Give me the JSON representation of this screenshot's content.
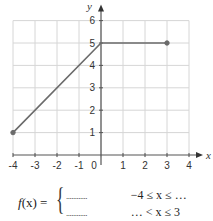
{
  "chart_data": {
    "type": "line",
    "title": "",
    "xlabel": "x",
    "ylabel": "y",
    "xlim": [
      -4,
      4
    ],
    "ylim": [
      0,
      6
    ],
    "grid": true,
    "x_ticks": [
      "-4",
      "-3",
      "-2",
      "-1",
      "0",
      "1",
      "2",
      "3",
      "4"
    ],
    "y_ticks": [
      "1",
      "2",
      "3",
      "4",
      "5",
      "6"
    ],
    "series": [
      {
        "name": "f(x)",
        "points": [
          {
            "x": -4,
            "y": 1
          },
          {
            "x": 0,
            "y": 5
          },
          {
            "x": 3,
            "y": 5
          }
        ],
        "endpoints": [
          {
            "x": -4,
            "y": 1,
            "marker": "closed"
          },
          {
            "x": 3,
            "y": 5,
            "marker": "closed"
          }
        ],
        "color": "#6b6b6b"
      }
    ],
    "annotations": [
      "f(x) = { ............  -4 ≤ x ≤ ...",
      "        ............  ... < x ≤ 3"
    ]
  },
  "formula": {
    "lhs_f": "f",
    "lhs_rest": "(x) =",
    "brace": "{",
    "rows": [
      {
        "expr": "............",
        "condition": "−4 ≤ x ≤ …"
      },
      {
        "expr": "............",
        "condition": "… < x ≤ 3"
      }
    ]
  },
  "axis": {
    "x_label": "x",
    "y_label": "y",
    "origin_label": "0"
  },
  "colors": {
    "grid": "#d6d6d6",
    "axis": "#555555",
    "line": "#6b6b6b"
  }
}
